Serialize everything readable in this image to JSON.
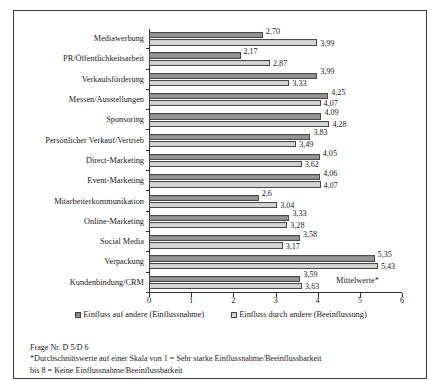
{
  "chart_data": {
    "type": "bar",
    "orientation": "horizontal",
    "title": "",
    "xlabel": "Mittelwerte*",
    "ylabel": "",
    "xlim": [
      0,
      6
    ],
    "xticks": [
      0,
      1,
      2,
      3,
      4,
      5,
      6
    ],
    "grid": false,
    "legend_position": "bottom",
    "decimal_separator": ",",
    "categories": [
      "Mediawerbung",
      "PR/Öffentlichkeitsarbeit",
      "Verkaufsförderung",
      "Messen/Ausstellungen",
      "Sponsoring",
      "Persönlicher Verkauf/Vertrieb",
      "Direct-Marketing",
      "Event-Marketing",
      "Mitarbeiterkommunikation",
      "Online-Marketing",
      "Social Media",
      "Verpackung",
      "Kundenbindung/CRM"
    ],
    "series": [
      {
        "name": "Einfluss auf andere (Einflussnahme)",
        "color": "#8d8d8d",
        "values": [
          2.7,
          2.17,
          3.99,
          4.25,
          4.09,
          3.83,
          4.05,
          4.06,
          2.6,
          3.33,
          3.58,
          5.35,
          3.59
        ],
        "labels": [
          "2,70",
          "2,17",
          "3,99",
          "4,25",
          "4,09",
          "3,83",
          "4,05",
          "4,06",
          "2,6",
          "3,33",
          "3,58",
          "5,35",
          "3,59"
        ]
      },
      {
        "name": "Einfluss durch andere (Beeinflussung)",
        "color": "#d2d2d2",
        "values": [
          3.99,
          2.87,
          3.33,
          4.07,
          4.28,
          3.49,
          3.62,
          4.07,
          3.04,
          3.28,
          3.17,
          5.43,
          3.63
        ],
        "labels": [
          "3,99",
          "2,87",
          "3,33",
          "4,07",
          "4,28",
          "3,49",
          "3,62",
          "4,07",
          "3,04",
          "3,28",
          "3,17",
          "5,43",
          "3,63"
        ]
      }
    ]
  },
  "axis": {
    "mittelwerte_label": "Mittelwerte*"
  },
  "footnote": {
    "line1": "Frage Nr. D 5/D 6",
    "line2": "*Durchschnittswerte auf einer Skala von 1 = Sehr starke Einflussnahme/Beeinflussbarkeit",
    "line3": "bis 8 = Keine Einflussnahme/Beeinflussbarkeit"
  }
}
